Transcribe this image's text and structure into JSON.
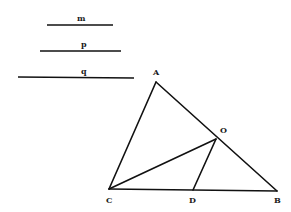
{
  "segments": [
    {
      "label": "m",
      "x1": 47,
      "x2": 113,
      "y": 25
    },
    {
      "label": "p",
      "x1": 40,
      "x2": 121,
      "y": 51
    },
    {
      "label": "q",
      "x1": 18,
      "x2": 134,
      "y": 77
    }
  ],
  "points": {
    "A": {
      "label": "A",
      "x": 156,
      "y": 82
    },
    "B": {
      "label": "B",
      "x": 277,
      "y": 191
    },
    "C": {
      "label": "C",
      "x": 109,
      "y": 189
    },
    "D": {
      "label": "D",
      "x": 193,
      "y": 190
    },
    "O": {
      "label": "O",
      "x": 216,
      "y": 139
    }
  },
  "edges": [
    [
      "A",
      "B"
    ],
    [
      "A",
      "C"
    ],
    [
      "C",
      "B"
    ],
    [
      "C",
      "O"
    ],
    [
      "O",
      "D"
    ]
  ],
  "colors": {
    "stroke": "#111111",
    "background": "#ffffff"
  }
}
